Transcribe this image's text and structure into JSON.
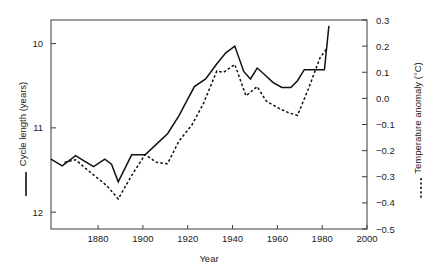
{
  "chart_data": {
    "type": "line",
    "title": "",
    "xlabel": "Year",
    "xlim": [
      1859,
      2000
    ],
    "xticks": [
      1880,
      1900,
      1920,
      1940,
      1960,
      1980,
      2000
    ],
    "xticklabels": [
      "1880",
      "1900",
      "1920",
      "1940",
      "1960",
      "1980",
      "2000"
    ],
    "grid": false,
    "legend_position": "outside-left-and-right-axis-labels",
    "axes": [
      {
        "id": "left",
        "ylabel": "Cycle length (years)",
        "ylim": [
          12.2,
          9.72
        ],
        "inverted": true,
        "yticks": [
          10,
          11,
          12
        ],
        "yticklabels": [
          "10",
          "11",
          "12"
        ],
        "legend_marker": "solid-line"
      },
      {
        "id": "right",
        "ylabel": "Temperature anomaly (°C)",
        "ylim": [
          -0.5,
          0.3
        ],
        "inverted": false,
        "yticks": [
          0.3,
          0.2,
          0.1,
          0.0,
          -0.1,
          -0.2,
          -0.3,
          -0.4,
          -0.5
        ],
        "yticklabels": [
          "0.3",
          "0.2",
          "0.1",
          "0.0",
          "−0.1",
          "−0.2",
          "−0.3",
          "−0.4",
          "−0.5"
        ],
        "legend_marker": "dotted-line"
      }
    ],
    "series": [
      {
        "name": "Cycle length (years)",
        "axis": "left",
        "style": "solid",
        "unit": "years",
        "x": [
          1859,
          1864,
          1870,
          1873,
          1878,
          1883,
          1886,
          1889,
          1895,
          1901,
          1905,
          1911,
          1916,
          1920,
          1923,
          1928,
          1933,
          1937,
          1941,
          1945,
          1948,
          1951,
          1954,
          1958,
          1962,
          1966,
          1969,
          1972,
          1977,
          1981,
          1983
        ],
        "y": [
          11.37,
          11.45,
          11.33,
          11.38,
          11.46,
          11.37,
          11.43,
          11.64,
          11.32,
          11.32,
          11.22,
          11.07,
          10.86,
          10.66,
          10.51,
          10.42,
          10.24,
          10.11,
          10.03,
          10.33,
          10.42,
          10.29,
          10.36,
          10.46,
          10.52,
          10.52,
          10.44,
          10.31,
          10.31,
          10.31,
          9.79
        ]
      },
      {
        "name": "Temperature anomaly (°C)",
        "axis": "right",
        "style": "dotted",
        "unit": "°C",
        "x": [
          1865,
          1870,
          1874,
          1879,
          1884,
          1889,
          1895,
          1901,
          1906,
          1911,
          1916,
          1922,
          1927,
          1933,
          1936,
          1941,
          1946,
          1951,
          1955,
          1960,
          1965,
          1969,
          1974,
          1979,
          1982
        ],
        "y": [
          -0.245,
          -0.235,
          -0.265,
          -0.3,
          -0.335,
          -0.385,
          -0.295,
          -0.215,
          -0.245,
          -0.25,
          -0.165,
          -0.1,
          -0.02,
          0.105,
          0.1,
          0.13,
          0.01,
          0.045,
          -0.01,
          -0.035,
          -0.055,
          -0.065,
          0.04,
          0.155,
          0.19
        ]
      }
    ],
    "annotations": []
  }
}
